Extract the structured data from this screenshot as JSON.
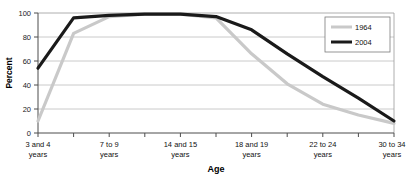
{
  "chart_data": {
    "type": "line",
    "title": "",
    "xlabel": "Age",
    "ylabel": "Percent",
    "ylim": [
      0,
      100
    ],
    "yticks": [
      0,
      20,
      40,
      60,
      80,
      100
    ],
    "grid": true,
    "legend_position": "top-right",
    "x": [
      "3 and 4 years",
      "5 and 6 years",
      "7 to 9 years",
      "10 to 13 years",
      "14 and 15 years",
      "16 and 17 years",
      "18 and 19 years",
      "20 and 21 years",
      "22 to 24 years",
      "25 to 29 years",
      "30 to 34 years"
    ],
    "xtick_labels": [
      "3 and 4\nyears",
      "",
      "7 to 9\nyears",
      "",
      "14 and 15\nyears",
      "",
      "18 and 19\nyears",
      "",
      "22 to 24\nyears",
      "",
      "30 to 34\nyears"
    ],
    "series": [
      {
        "name": "1964",
        "color": "#c9c9c9",
        "values": [
          10,
          83,
          97,
          99,
          99,
          96,
          66,
          41,
          24,
          15,
          8
        ]
      },
      {
        "name": "2004",
        "color": "#1a1a1a",
        "values": [
          54,
          96,
          98,
          99,
          99,
          97,
          86,
          66,
          47,
          29,
          10
        ]
      }
    ]
  },
  "axis": {
    "y_ticks": [
      "0",
      "20",
      "40",
      "60",
      "80",
      "100"
    ],
    "y_title": "Percent",
    "x_title": "Age",
    "x_ticks": [
      {
        "line1": "3 and 4",
        "line2": "years"
      },
      {
        "line1": "7 to 9",
        "line2": "years"
      },
      {
        "line1": "14 and 15",
        "line2": "years"
      },
      {
        "line1": "18 and 19",
        "line2": "years"
      },
      {
        "line1": "22 to 24",
        "line2": "years"
      },
      {
        "line1": "30 to 34",
        "line2": "years"
      }
    ]
  },
  "legend": {
    "entries": [
      {
        "label": "1964",
        "color": "#c9c9c9"
      },
      {
        "label": "2004",
        "color": "#1a1a1a"
      }
    ]
  }
}
